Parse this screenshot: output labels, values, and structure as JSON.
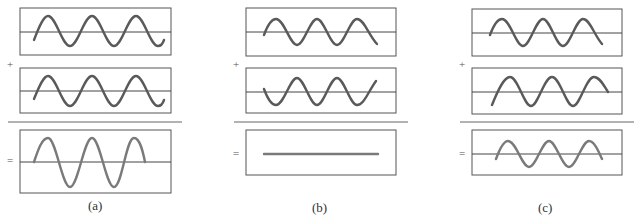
{
  "panels": [
    {
      "label": "(a)",
      "case": "constructive interference",
      "result": "amplitude doubled"
    },
    {
      "label": "(b)",
      "case": "destructive interference",
      "result": "flat line (cancel)"
    },
    {
      "label": "(c)",
      "case": "partial interference",
      "result": "reduced amplitude"
    }
  ],
  "operators": {
    "plus": "+",
    "equals": "="
  },
  "colors": {
    "frame": "#555555",
    "wave": "#5a5a5a",
    "result_wave": "#7a7a7a",
    "axis": "#444444"
  }
}
